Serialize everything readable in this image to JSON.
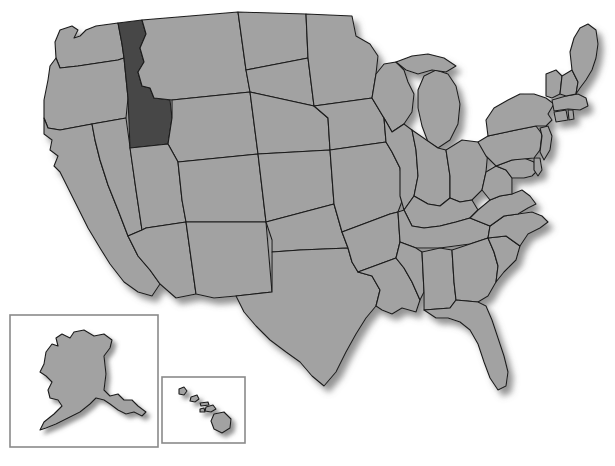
{
  "map": {
    "title": "United States map with Idaho highlighted",
    "projection": "albers-usa",
    "background_color": "#ffffff",
    "state_fill_color": "#a2a2a2",
    "highlight_fill_color": "#474747",
    "border_color": "#1c1c1c",
    "inset_border_color": "#8a8a8a",
    "shadow_color": "#8d8d8d",
    "highlighted_states": [
      "Idaho"
    ],
    "insets": [
      {
        "name": "Alaska",
        "label": "alaska-inset",
        "x": 10,
        "y": 315,
        "width": 148,
        "height": 132
      },
      {
        "name": "Hawaii",
        "label": "hawaii-inset",
        "x": 162,
        "y": 377,
        "width": 83,
        "height": 66
      }
    ],
    "states": [
      "Washington",
      "Oregon",
      "California",
      "Nevada",
      "Idaho",
      "Montana",
      "Wyoming",
      "Utah",
      "Arizona",
      "Colorado",
      "New Mexico",
      "North Dakota",
      "South Dakota",
      "Nebraska",
      "Kansas",
      "Oklahoma",
      "Texas",
      "Minnesota",
      "Iowa",
      "Missouri",
      "Arkansas",
      "Louisiana",
      "Wisconsin",
      "Illinois",
      "Michigan",
      "Indiana",
      "Ohio",
      "Kentucky",
      "Tennessee",
      "Mississippi",
      "Alabama",
      "Georgia",
      "Florida",
      "South Carolina",
      "North Carolina",
      "Virginia",
      "West Virginia",
      "Maryland",
      "Delaware",
      "Pennsylvania",
      "New Jersey",
      "New York",
      "Connecticut",
      "Rhode Island",
      "Massachusetts",
      "Vermont",
      "New Hampshire",
      "Maine",
      "Alaska",
      "Hawaii"
    ]
  }
}
